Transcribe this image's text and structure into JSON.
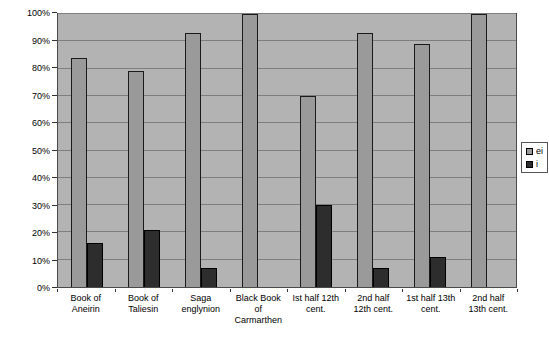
{
  "chart_data": {
    "type": "bar",
    "title": "",
    "xlabel": "",
    "ylabel": "",
    "categories": [
      "Book of\nAneirin",
      "Book of\nTaliesin",
      "Saga\nenglynion",
      "Black Book\nof\nCarmarthen",
      "Ist half 12th\ncent.",
      "2nd half\n12th cent.",
      "1st half 13th\ncent.",
      "2nd half\n13th cent."
    ],
    "series": [
      {
        "name": "ei",
        "color": "#9a9a9a",
        "border": "#1a1a1a",
        "values": [
          84,
          79,
          93,
          100,
          70,
          93,
          89,
          100
        ]
      },
      {
        "name": "i",
        "color": "#2d2d2d",
        "border": "#000000",
        "values": [
          16,
          21,
          7,
          0,
          30,
          7,
          11,
          0
        ]
      }
    ],
    "ylim": [
      0,
      100
    ],
    "y_tick_labels": [
      "0%",
      "10%",
      "20%",
      "30%",
      "40%",
      "50%",
      "60%",
      "70%",
      "80%",
      "90%",
      "100%"
    ],
    "grid": true,
    "legend_position": "right",
    "colors": {
      "page_bg": "#ffffff",
      "plot_bg": "#b3b3b3",
      "gridline": "#7e7e7e",
      "plot_border": "#4a4a4a",
      "axis_text": "#000000",
      "legend_bg": "#ffffff",
      "legend_border": "#555555"
    }
  }
}
